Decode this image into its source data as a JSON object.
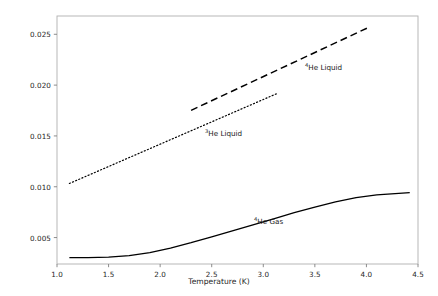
{
  "chart_data": {
    "type": "line",
    "title": "",
    "xlabel": "Temperature (K)",
    "ylabel": "Thermal Conductivity (W/m·K)",
    "xlim": [
      1.0,
      4.5
    ],
    "ylim": [
      0.0024,
      0.0268
    ],
    "xticks": [
      1.0,
      1.5,
      2.0,
      2.5,
      3.0,
      3.5,
      4.0,
      4.5
    ],
    "xticklabels": [
      "1.0",
      "1.5",
      "2.0",
      "2.5",
      "3.0",
      "3.5",
      "4.0",
      "4.5"
    ],
    "yticks": [
      0.005,
      0.01,
      0.015,
      0.02,
      0.025
    ],
    "yticklabels": [
      "0.005",
      "0.010",
      "0.015",
      "0.020",
      "0.025"
    ],
    "grid": false,
    "legend_position": "inline-annotations",
    "series": [
      {
        "name": "⁴He Gas",
        "label_html": "<sup>4</sup>He Gas",
        "linestyle": "solid",
        "color": "#000000",
        "linewidth": 1.3,
        "x": [
          1.12,
          1.3,
          1.5,
          1.7,
          1.9,
          2.1,
          2.3,
          2.5,
          2.7,
          2.9,
          3.1,
          3.3,
          3.5,
          3.7,
          3.9,
          4.1,
          4.42
        ],
        "y": [
          0.00302,
          0.00303,
          0.00308,
          0.00322,
          0.00352,
          0.00397,
          0.0045,
          0.00508,
          0.00565,
          0.00625,
          0.00685,
          0.00745,
          0.008,
          0.00852,
          0.00893,
          0.00921,
          0.00943
        ]
      },
      {
        "name": "³He Liquid",
        "label_html": "<sup>3</sup>He Liquid",
        "linestyle": "dotted",
        "color": "#000000",
        "linewidth": 1.2,
        "x": [
          1.12,
          3.14
        ],
        "y": [
          0.01032,
          0.0192
        ]
      },
      {
        "name": "⁴He Liquid",
        "label_html": "<sup>4</sup>He Liquid",
        "linestyle": "dashed",
        "color": "#000000",
        "linewidth": 1.5,
        "x": [
          2.3,
          4.03
        ],
        "y": [
          0.01752,
          0.02572
        ]
      }
    ],
    "annotations": [
      {
        "text_html": "<sup>4</sup>He Liquid",
        "x_px": 305,
        "y_px": 63,
        "for_series": "⁴He Liquid"
      },
      {
        "text_html": "<sup>3</sup>He Liquid",
        "x_px": 205,
        "y_px": 129,
        "for_series": "³He Liquid"
      },
      {
        "text_html": "<sup>4</sup>He Gas",
        "x_px": 254,
        "y_px": 217,
        "for_series": "⁴He Gas"
      }
    ],
    "axes_style": {
      "spine_color": "#b0b0b0",
      "tick_color": "#808080",
      "text_color": "#262626",
      "background": "#ffffff"
    }
  },
  "layout": {
    "plot_left_px": 57,
    "plot_right_px": 418,
    "plot_top_px": 16,
    "plot_bottom_px": 264
  }
}
